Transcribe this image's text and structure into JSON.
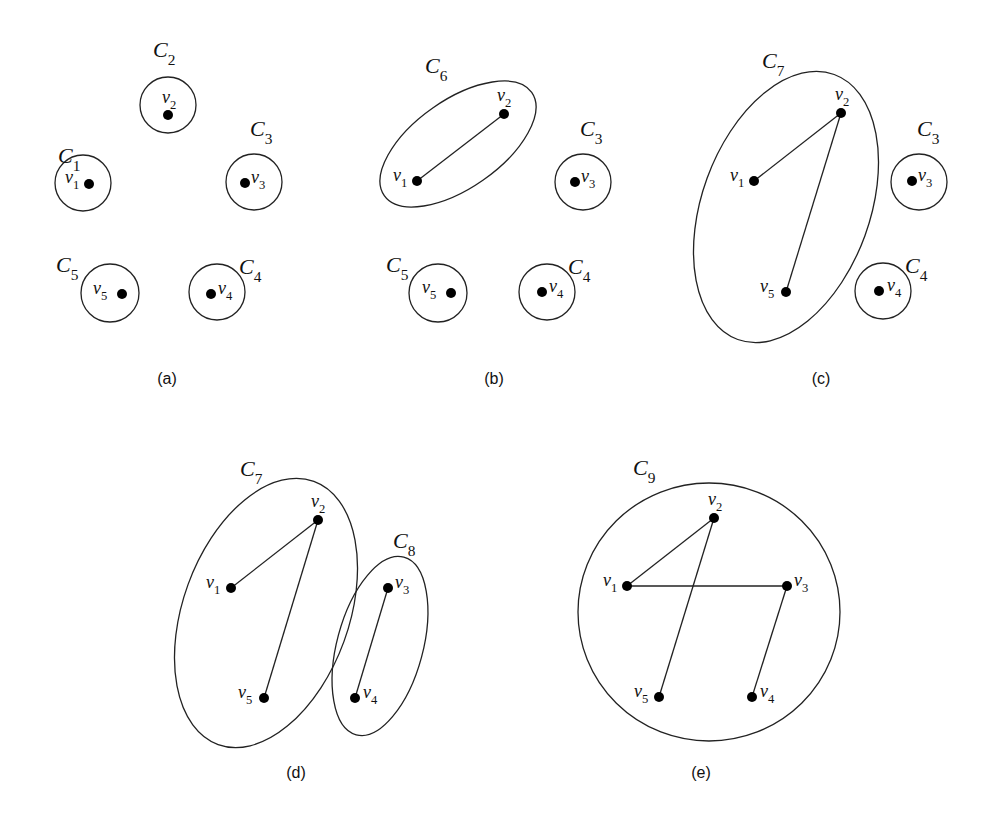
{
  "panels": [
    {
      "caption": "(a)",
      "clusters": [
        {
          "name": "C",
          "sub": "1",
          "label_pos": [
            58,
            163
          ],
          "shape": {
            "cx": 83,
            "cy": 183,
            "rx": 28,
            "ry": 28,
            "rot": 0
          }
        },
        {
          "name": "C",
          "sub": "2",
          "label_pos": [
            153,
            57
          ],
          "shape": {
            "cx": 168,
            "cy": 105,
            "rx": 28,
            "ry": 28,
            "rot": 0
          }
        },
        {
          "name": "C",
          "sub": "3",
          "label_pos": [
            250,
            136
          ],
          "shape": {
            "cx": 254,
            "cy": 182,
            "rx": 28,
            "ry": 28,
            "rot": 0
          }
        },
        {
          "name": "C",
          "sub": "4",
          "label_pos": [
            239,
            274
          ],
          "shape": {
            "cx": 217,
            "cy": 292,
            "rx": 28,
            "ry": 28,
            "rot": 0
          }
        },
        {
          "name": "C",
          "sub": "5",
          "label_pos": [
            56,
            272
          ],
          "shape": {
            "cx": 110,
            "cy": 293,
            "rx": 29,
            "ry": 29,
            "rot": 0
          }
        }
      ],
      "nodes": [
        {
          "name": "v",
          "sub": "1",
          "x": 89,
          "y": 184,
          "lx": 65,
          "ly": 183
        },
        {
          "name": "v",
          "sub": "2",
          "x": 168,
          "y": 115,
          "lx": 162,
          "ly": 103
        },
        {
          "name": "v",
          "sub": "3",
          "x": 245,
          "y": 183,
          "lx": 251,
          "ly": 183
        },
        {
          "name": "v",
          "sub": "4",
          "x": 211,
          "y": 294,
          "lx": 218,
          "ly": 294
        },
        {
          "name": "v",
          "sub": "5",
          "x": 122,
          "y": 294,
          "lx": 93,
          "ly": 294
        }
      ],
      "edges": []
    },
    {
      "caption": "(b)",
      "clusters": [
        {
          "name": "C",
          "sub": "6",
          "label_pos": [
            425,
            73
          ],
          "shape": {
            "cx": 458,
            "cy": 144,
            "rx": 90,
            "ry": 44,
            "rot": -35
          }
        },
        {
          "name": "C",
          "sub": "3",
          "label_pos": [
            580,
            136
          ],
          "shape": {
            "cx": 583,
            "cy": 182,
            "rx": 28,
            "ry": 28,
            "rot": 0
          }
        },
        {
          "name": "C",
          "sub": "4",
          "label_pos": [
            568,
            274
          ],
          "shape": {
            "cx": 547,
            "cy": 292,
            "rx": 28,
            "ry": 28,
            "rot": 0
          }
        },
        {
          "name": "C",
          "sub": "5",
          "label_pos": [
            386,
            272
          ],
          "shape": {
            "cx": 438,
            "cy": 293,
            "rx": 29,
            "ry": 29,
            "rot": 0
          }
        }
      ],
      "nodes": [
        {
          "name": "v",
          "sub": "1",
          "x": 417,
          "y": 181,
          "lx": 393,
          "ly": 181
        },
        {
          "name": "v",
          "sub": "2",
          "x": 504,
          "y": 114,
          "lx": 497,
          "ly": 101
        },
        {
          "name": "v",
          "sub": "3",
          "x": 575,
          "y": 182,
          "lx": 581,
          "ly": 182
        },
        {
          "name": "v",
          "sub": "4",
          "x": 542,
          "y": 292,
          "lx": 549,
          "ly": 292
        },
        {
          "name": "v",
          "sub": "5",
          "x": 451,
          "y": 293,
          "lx": 422,
          "ly": 293
        }
      ],
      "edges": [
        [
          "1",
          "2"
        ]
      ]
    },
    {
      "caption": "(c)",
      "clusters": [
        {
          "name": "C",
          "sub": "7",
          "label_pos": [
            762,
            68
          ],
          "shape": {
            "cx": 786,
            "cy": 207,
            "rx": 84,
            "ry": 141,
            "rot": 20
          }
        },
        {
          "name": "C",
          "sub": "3",
          "label_pos": [
            917,
            136
          ],
          "shape": {
            "cx": 919,
            "cy": 182,
            "rx": 28,
            "ry": 28,
            "rot": 0
          }
        },
        {
          "name": "C",
          "sub": "4",
          "label_pos": [
            905,
            273
          ],
          "shape": {
            "cx": 883,
            "cy": 291,
            "rx": 28,
            "ry": 28,
            "rot": 0
          }
        }
      ],
      "nodes": [
        {
          "name": "v",
          "sub": "1",
          "x": 754,
          "y": 181,
          "lx": 730,
          "ly": 181
        },
        {
          "name": "v",
          "sub": "2",
          "x": 841,
          "y": 113,
          "lx": 835,
          "ly": 100
        },
        {
          "name": "v",
          "sub": "5",
          "x": 786,
          "y": 292,
          "lx": 760,
          "ly": 292
        },
        {
          "name": "v",
          "sub": "3",
          "x": 912,
          "y": 181,
          "lx": 918,
          "ly": 181
        },
        {
          "name": "v",
          "sub": "4",
          "x": 879,
          "y": 291,
          "lx": 887,
          "ly": 291
        }
      ],
      "edges": [
        [
          "1",
          "2"
        ],
        [
          "2",
          "5"
        ]
      ]
    },
    {
      "caption": "(d)",
      "clusters": [
        {
          "name": "C",
          "sub": "7",
          "label_pos": [
            240,
            476
          ],
          "shape": {
            "cx": 266,
            "cy": 613,
            "rx": 83,
            "ry": 140,
            "rot": 20
          }
        },
        {
          "name": "C",
          "sub": "8",
          "label_pos": [
            393,
            548
          ],
          "shape": {
            "cx": 380,
            "cy": 646,
            "rx": 43,
            "ry": 92,
            "rot": 15
          }
        }
      ],
      "nodes": [
        {
          "name": "v",
          "sub": "1",
          "x": 231,
          "y": 588,
          "lx": 206,
          "ly": 588
        },
        {
          "name": "v",
          "sub": "2",
          "x": 318,
          "y": 520,
          "lx": 311,
          "ly": 507
        },
        {
          "name": "v",
          "sub": "5",
          "x": 264,
          "y": 698,
          "lx": 238,
          "ly": 698
        },
        {
          "name": "v",
          "sub": "3",
          "x": 388,
          "y": 588,
          "lx": 395,
          "ly": 588
        },
        {
          "name": "v",
          "sub": "4",
          "x": 355,
          "y": 698,
          "lx": 363,
          "ly": 698
        }
      ],
      "edges": [
        [
          "1",
          "2"
        ],
        [
          "2",
          "5"
        ],
        [
          "3",
          "4"
        ]
      ]
    },
    {
      "caption": "(e)",
      "clusters": [
        {
          "name": "C",
          "sub": "9",
          "label_pos": [
            633,
            475
          ],
          "shape": {
            "cx": 709,
            "cy": 612,
            "rx": 131,
            "ry": 129,
            "rot": 0
          }
        }
      ],
      "nodes": [
        {
          "name": "v",
          "sub": "2",
          "x": 714,
          "y": 518,
          "lx": 708,
          "ly": 505
        },
        {
          "name": "v",
          "sub": "1",
          "x": 627,
          "y": 586,
          "lx": 603,
          "ly": 586
        },
        {
          "name": "v",
          "sub": "3",
          "x": 787,
          "y": 586,
          "lx": 794,
          "ly": 586
        },
        {
          "name": "v",
          "sub": "5",
          "x": 659,
          "y": 697,
          "lx": 634,
          "ly": 697
        },
        {
          "name": "v",
          "sub": "4",
          "x": 752,
          "y": 697,
          "lx": 760,
          "ly": 697
        }
      ],
      "edges": [
        [
          "1",
          "2"
        ],
        [
          "2",
          "5"
        ],
        [
          "1",
          "3"
        ],
        [
          "3",
          "4"
        ]
      ]
    }
  ],
  "captions_pos": [
    [
      167,
      384
    ],
    [
      494,
      384
    ],
    [
      821,
      384
    ],
    [
      296,
      778
    ],
    [
      701,
      778
    ]
  ]
}
